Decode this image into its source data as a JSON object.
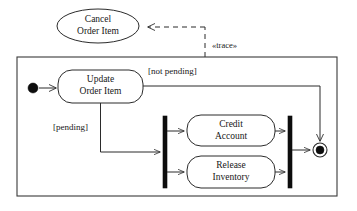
{
  "diagram": {
    "type": "uml-activity-diagram",
    "title": "",
    "colors": {
      "stroke": "#2b2b2b",
      "fill": "#ffffff",
      "solid": "#0d0d0d",
      "frame": "#3a3a3a"
    },
    "frame": {
      "name": "activity-frame",
      "x": 17,
      "y": 57,
      "width": 320,
      "height": 139
    },
    "external_use_case": {
      "label_line1": "Cancel",
      "label_line2": "Order Item",
      "cx": 98,
      "cy": 26,
      "rx": 41,
      "ry": 17
    },
    "dependency": {
      "stereotype": "«trace»",
      "style": "dashed"
    },
    "nodes": [
      {
        "id": "initial",
        "kind": "initial-node",
        "label": "",
        "cx": 33,
        "cy": 88,
        "r": 5
      },
      {
        "id": "update-order-item",
        "kind": "action",
        "label_line1": "Update",
        "label_line2": "Order Item",
        "x": 58,
        "y": 70,
        "width": 85,
        "height": 33
      },
      {
        "id": "fork",
        "kind": "fork-bar",
        "label": "",
        "x": 163,
        "y": 116,
        "width": 4,
        "height": 72
      },
      {
        "id": "credit-account",
        "kind": "action",
        "label_line1": "Credit",
        "label_line2": "Account",
        "x": 187,
        "y": 115,
        "width": 88,
        "height": 31
      },
      {
        "id": "release-inventory",
        "kind": "action",
        "label_line1": "Release",
        "label_line2": "Inventory",
        "x": 187,
        "y": 156,
        "width": 88,
        "height": 32
      },
      {
        "id": "join",
        "kind": "join-bar",
        "label": "",
        "x": 288,
        "y": 116,
        "width": 4,
        "height": 72
      },
      {
        "id": "final",
        "kind": "final-node",
        "label": "",
        "cx": 320,
        "cy": 150,
        "r_outer": 7,
        "r_inner": 4
      }
    ],
    "guards": [
      {
        "id": "guard-not-pending",
        "text": "[not pending]",
        "x": 148,
        "y": 72
      },
      {
        "id": "guard-pending",
        "text": "[pending]",
        "x": 53,
        "y": 128
      }
    ]
  }
}
